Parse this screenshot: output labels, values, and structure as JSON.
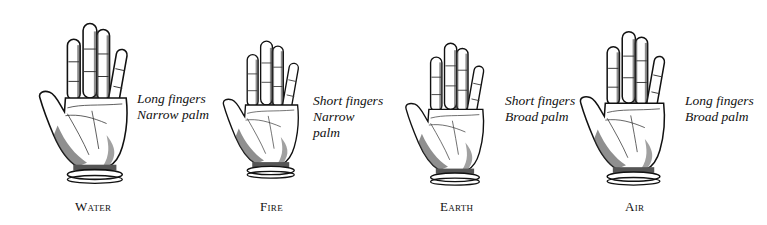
{
  "figure": {
    "panels": [
      {
        "element": "Water",
        "lines": [
          "Long fingers",
          "Narrow palm"
        ]
      },
      {
        "element": "Fire",
        "lines": [
          "Short fingers",
          "Narrow",
          "palm"
        ]
      },
      {
        "element": "Earth",
        "lines": [
          "Short fingers",
          "Broad palm"
        ]
      },
      {
        "element": "Air",
        "lines": [
          "Long fingers",
          "Broad palm"
        ]
      }
    ]
  },
  "colors": {
    "ink": "#111111",
    "shade": "#555555",
    "background": "#ffffff"
  }
}
